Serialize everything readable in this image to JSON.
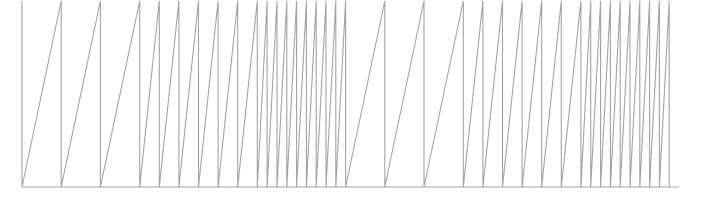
{
  "chart_data": {
    "type": "line",
    "title": "",
    "xlabel": "",
    "ylabel": "",
    "grid": false,
    "legend": null,
    "line_color": "#a3a3a3",
    "xlim": [
      0,
      67
    ],
    "ylim": [
      0,
      1
    ],
    "periods": [
      4,
      4,
      4,
      2,
      2,
      2,
      2,
      2,
      2,
      1,
      1,
      1,
      1,
      1,
      1,
      1,
      1,
      1,
      4,
      4,
      4,
      2,
      2,
      2,
      2,
      2,
      2,
      1,
      1,
      1,
      1,
      1,
      1,
      1,
      1,
      1
    ],
    "series": [
      {
        "name": "sawtooth",
        "x_reset_points": [
          0,
          4,
          8,
          12,
          14,
          16,
          18,
          20,
          22,
          24,
          25,
          26,
          27,
          28,
          29,
          30,
          31,
          32,
          33,
          37,
          41,
          45,
          47,
          49,
          51,
          53,
          55,
          57,
          58,
          59,
          60,
          61,
          62,
          63,
          64,
          65,
          66
        ],
        "pattern": "linear rise from 0 to 1 over each period, then instantaneous drop to 0"
      }
    ]
  }
}
